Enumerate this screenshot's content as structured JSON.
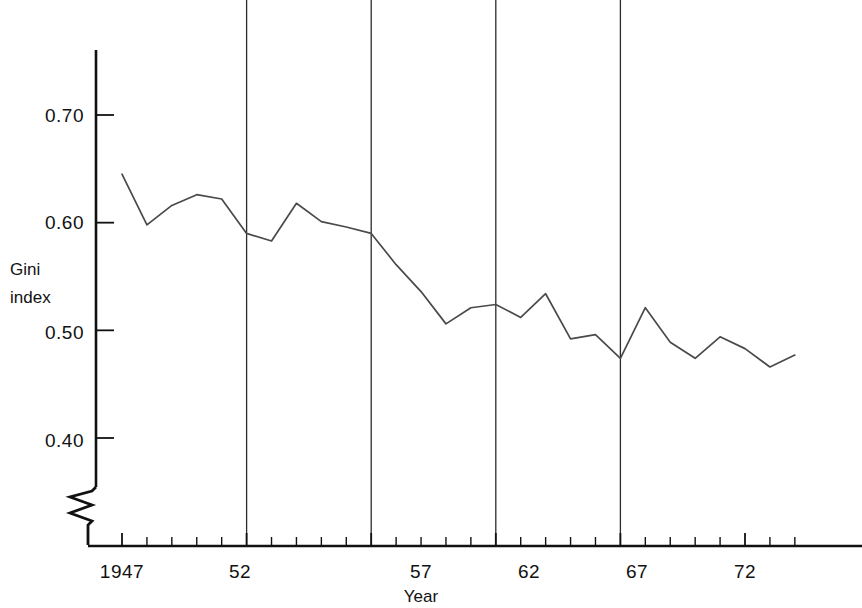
{
  "chart_data": {
    "type": "line",
    "title": "",
    "xlabel": "Year",
    "ylabel": "Gini index",
    "xlim": [
      1947,
      1974
    ],
    "ylim": [
      0.355,
      0.745
    ],
    "grid": false,
    "legend": null,
    "y_ticks": [
      0.7,
      0.6,
      0.5,
      0.4
    ],
    "y_tick_labels": [
      "0.70",
      "0.60",
      "0.50",
      "0.40"
    ],
    "x_ticks": [
      1947,
      1952,
      1957,
      1962,
      1967,
      1972
    ],
    "x_tick_labels": [
      "1947",
      "52",
      "57",
      "62",
      "67",
      "72"
    ],
    "x_minor_ticks": [
      1947,
      1948,
      1949,
      1950,
      1951,
      1952,
      1953,
      1954,
      1955,
      1956,
      1957,
      1958,
      1959,
      1960,
      1961,
      1962,
      1963,
      1964,
      1965,
      1966,
      1967,
      1968,
      1969,
      1970,
      1971,
      1972,
      1973,
      1974
    ],
    "vertical_reference_lines": [
      1952,
      1957,
      1962,
      1967
    ],
    "axis_break": true,
    "axis_break_note": "zigzag break on y-axis below 0.40",
    "line_color": "#4a4a4a",
    "axis_color": "#111111",
    "x": [
      1947,
      1948,
      1949,
      1950,
      1951,
      1952,
      1953,
      1954,
      1955,
      1956,
      1957,
      1958,
      1959,
      1960,
      1961,
      1962,
      1963,
      1964,
      1965,
      1966,
      1967,
      1968,
      1969,
      1970,
      1971,
      1972,
      1973,
      1974
    ],
    "values": [
      0.645,
      0.598,
      0.616,
      0.626,
      0.622,
      0.59,
      0.583,
      0.618,
      0.601,
      0.596,
      0.59,
      0.561,
      0.536,
      0.506,
      0.521,
      0.524,
      0.512,
      0.534,
      0.492,
      0.496,
      0.474,
      0.521,
      0.489,
      0.474,
      0.494,
      0.483,
      0.466,
      0.477
    ],
    "series": [
      {
        "name": "Gini index",
        "points": [
          {
            "year": 1947,
            "value": 0.645
          },
          {
            "year": 1948,
            "value": 0.598
          },
          {
            "year": 1949,
            "value": 0.616
          },
          {
            "year": 1950,
            "value": 0.626
          },
          {
            "year": 1951,
            "value": 0.622
          },
          {
            "year": 1952,
            "value": 0.59
          },
          {
            "year": 1953,
            "value": 0.583
          },
          {
            "year": 1954,
            "value": 0.618
          },
          {
            "year": 1955,
            "value": 0.601
          },
          {
            "year": 1956,
            "value": 0.596
          },
          {
            "year": 1957,
            "value": 0.59
          },
          {
            "year": 1958,
            "value": 0.561
          },
          {
            "year": 1959,
            "value": 0.536
          },
          {
            "year": 1960,
            "value": 0.506
          },
          {
            "year": 1961,
            "value": 0.521
          },
          {
            "year": 1962,
            "value": 0.524
          },
          {
            "year": 1963,
            "value": 0.512
          },
          {
            "year": 1964,
            "value": 0.534
          },
          {
            "year": 1965,
            "value": 0.492
          },
          {
            "year": 1966,
            "value": 0.496
          },
          {
            "year": 1967,
            "value": 0.474
          },
          {
            "year": 1968,
            "value": 0.521
          },
          {
            "year": 1969,
            "value": 0.489
          },
          {
            "year": 1970,
            "value": 0.474
          },
          {
            "year": 1971,
            "value": 0.494
          },
          {
            "year": 1972,
            "value": 0.483
          },
          {
            "year": 1973,
            "value": 0.466
          },
          {
            "year": 1974,
            "value": 0.477
          }
        ]
      }
    ]
  },
  "labels": {
    "y_axis_line1": "Gini",
    "y_axis_line2": "index",
    "x_axis_title": "Year",
    "y0": "0.70",
    "y1": "0.60",
    "y2": "0.50",
    "y3": "0.40",
    "x0": "1947",
    "x1": "52",
    "x2": "57",
    "x3": "62",
    "x4": "67",
    "x5": "72"
  }
}
